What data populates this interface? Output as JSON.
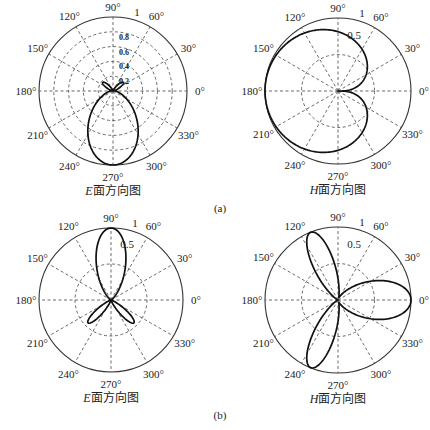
{
  "figure": {
    "subfigure_labels": [
      "(a)",
      "(b)"
    ]
  },
  "chart_data": [
    {
      "id": "a-E",
      "type": "polar-line",
      "group": "(a)",
      "title_letter": "E",
      "title_rest": "面方向图",
      "center": [
        113,
        91
      ],
      "radius": 74,
      "angle_ticks": [
        "0°",
        "30°",
        "60°",
        "90°",
        "120°",
        "150°",
        "180°",
        "210°",
        "240°",
        "270°",
        "300°",
        "330°"
      ],
      "r_ticks": [
        "0.2",
        "0.4",
        "0.6",
        "0.8",
        "1"
      ],
      "r_grid": [
        0.2,
        0.4,
        0.6,
        0.8
      ],
      "series": [
        {
          "name": "E-plane pattern",
          "formula": "aE"
        }
      ],
      "description": "Main lobe toward 270° with magnitude 1; small side lobes near 45° and 135° (~0.2)"
    },
    {
      "id": "a-H",
      "type": "polar-line",
      "group": "(a)",
      "title_letter": "H",
      "title_rest": "面方向图",
      "center": [
        338,
        91
      ],
      "radius": 73,
      "angle_ticks": [
        "0°",
        "30°",
        "60°",
        "90°",
        "120°",
        "150°",
        "180°",
        "210°",
        "240°",
        "270°",
        "300°",
        "330°"
      ],
      "r_ticks": [
        "0.5",
        "1"
      ],
      "r_grid": [
        0.5
      ],
      "series": [
        {
          "name": "H-plane pattern",
          "formula": "aH"
        }
      ],
      "description": "Cardioid-like pattern with maximum 1 toward 180° and null at 0°"
    },
    {
      "id": "b-E",
      "type": "polar-line",
      "group": "(b)",
      "title_letter": "E",
      "title_rest": "面方向图",
      "center": [
        111,
        300
      ],
      "radius": 72,
      "angle_ticks": [
        "0°",
        "30°",
        "60°",
        "90°",
        "120°",
        "150°",
        "180°",
        "210°",
        "240°",
        "270°",
        "300°",
        "330°"
      ],
      "r_ticks": [
        "0.5",
        "1"
      ],
      "r_grid": [
        0.5
      ],
      "series": [
        {
          "name": "E-plane pattern",
          "formula": "bE"
        }
      ],
      "description": "Main lobe toward 90° (magnitude 1); two minor lobes toward 225° and 315° (~0.45)"
    },
    {
      "id": "b-H",
      "type": "polar-line",
      "group": "(b)",
      "title_letter": "H",
      "title_rest": "面方向图",
      "center": [
        338,
        300
      ],
      "radius": 73,
      "angle_ticks": [
        "0°",
        "30°",
        "60°",
        "90°",
        "120°",
        "150°",
        "180°",
        "210°",
        "240°",
        "270°",
        "300°",
        "330°"
      ],
      "r_ticks": [
        "0.5",
        "1"
      ],
      "r_grid": [
        0.5
      ],
      "series": [
        {
          "name": "H-plane pattern",
          "formula": "bH"
        }
      ],
      "description": "Three lobes of magnitude 1 toward 0°, 115° and 245°"
    }
  ]
}
